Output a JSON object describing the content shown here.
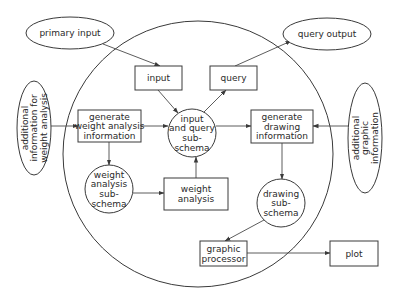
{
  "diagram": {
    "boundary": {
      "label": "system"
    },
    "external_nodes": [
      {
        "id": "primary_input",
        "lines": [
          "primary input"
        ],
        "shape": "ellipse"
      },
      {
        "id": "query_output",
        "lines": [
          "query output"
        ],
        "shape": "ellipse"
      },
      {
        "id": "additional_weight",
        "lines": [
          "additional",
          "information for",
          "weight analysis"
        ],
        "shape": "ellipse-vertical"
      },
      {
        "id": "additional_graphic",
        "lines": [
          "additional",
          "graphic",
          "information"
        ],
        "shape": "ellipse-vertical"
      }
    ],
    "process_nodes": [
      {
        "id": "input",
        "lines": [
          "input"
        ],
        "shape": "box"
      },
      {
        "id": "query",
        "lines": [
          "query"
        ],
        "shape": "box"
      },
      {
        "id": "gen_weight",
        "lines": [
          "generate",
          "weight analysis",
          "information"
        ],
        "shape": "box"
      },
      {
        "id": "gen_drawing",
        "lines": [
          "generate",
          "drawing",
          "information"
        ],
        "shape": "box"
      },
      {
        "id": "weight_analysis",
        "lines": [
          "weight",
          "analysis"
        ],
        "shape": "box"
      },
      {
        "id": "graphic_processor",
        "lines": [
          "graphic",
          "processor"
        ],
        "shape": "box"
      },
      {
        "id": "plot",
        "lines": [
          "plot"
        ],
        "shape": "box"
      }
    ],
    "schema_nodes": [
      {
        "id": "iq_schema",
        "lines": [
          "input",
          "and query",
          "sub-",
          "schema"
        ],
        "shape": "circle"
      },
      {
        "id": "weight_schema",
        "lines": [
          "weight",
          "analysis",
          "sub-",
          "schema"
        ],
        "shape": "circle"
      },
      {
        "id": "drawing_schema",
        "lines": [
          "drawing",
          "sub-",
          "schema"
        ],
        "shape": "circle"
      }
    ],
    "edges": [
      {
        "from": "primary_input",
        "to": "input"
      },
      {
        "from": "input",
        "to": "iq_schema"
      },
      {
        "from": "iq_schema",
        "to": "query"
      },
      {
        "from": "query",
        "to": "query_output"
      },
      {
        "from": "additional_weight",
        "to": "gen_weight"
      },
      {
        "from": "gen_weight",
        "to": "iq_schema"
      },
      {
        "from": "gen_weight",
        "to": "weight_schema"
      },
      {
        "from": "weight_schema",
        "to": "weight_analysis"
      },
      {
        "from": "weight_analysis",
        "to": "iq_schema"
      },
      {
        "from": "iq_schema",
        "to": "gen_drawing"
      },
      {
        "from": "additional_graphic",
        "to": "gen_drawing"
      },
      {
        "from": "gen_drawing",
        "to": "drawing_schema"
      },
      {
        "from": "drawing_schema",
        "to": "graphic_processor"
      },
      {
        "from": "graphic_processor",
        "to": "plot"
      }
    ]
  }
}
